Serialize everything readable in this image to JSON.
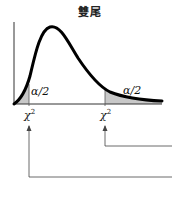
{
  "title": "雙尾",
  "labels": {
    "left_tail_area": "α/2",
    "right_tail_area": "α/2",
    "left_critical_symbol": "χ",
    "left_critical_exp": "2",
    "right_critical_symbol": "χ",
    "right_critical_exp": "2"
  },
  "colors": {
    "curve": "#000000",
    "axis": "#333333",
    "shade": "#c8c8c8",
    "arrow": "#444444"
  },
  "diagram": {
    "type": "chi-square distribution, two-tailed test",
    "regions": [
      "left rejection region α/2",
      "right rejection region α/2"
    ],
    "critical_values": [
      "χ² (lower)",
      "χ² (upper)"
    ]
  }
}
